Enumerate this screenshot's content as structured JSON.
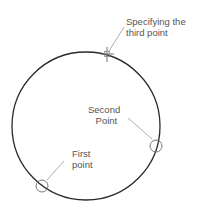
{
  "diagram": {
    "labels": {
      "third_line1": "Specifying the",
      "third_line2": "third point",
      "second_line1": "Second",
      "second_line2": "Point",
      "first_line1": "First",
      "first_line2": "point"
    },
    "colors": {
      "circle": "#2a2a2a",
      "marker": "#777777",
      "leader": "#999999",
      "text": "#555555"
    }
  }
}
